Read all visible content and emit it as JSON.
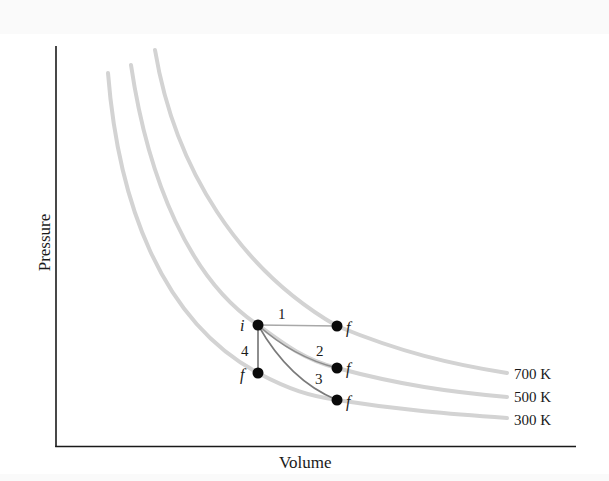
{
  "diagram": {
    "type": "PV diagram with isotherms",
    "axes": {
      "x_label": "Volume",
      "y_label": "Pressure"
    },
    "isotherms": [
      {
        "label": "700 K",
        "color": "#d0d0d0"
      },
      {
        "label": "500 K",
        "color": "#d0d0d0"
      },
      {
        "label": "300 K",
        "color": "#d0d0d0"
      }
    ],
    "initial_state": {
      "label": "i"
    },
    "final_states": [
      {
        "label": "f",
        "path": "1"
      },
      {
        "label": "f",
        "path": "2"
      },
      {
        "label": "f",
        "path": "3"
      },
      {
        "label": "f",
        "path": "4"
      }
    ],
    "paths": [
      {
        "label": "1",
        "description": "isobaric expansion from i to f on 700 K isotherm"
      },
      {
        "label": "2",
        "description": "curved path from i to f on 500 K isotherm"
      },
      {
        "label": "3",
        "description": "curved path from i to f on 300 K isotherm"
      },
      {
        "label": "4",
        "description": "isochoric path from i to f on 300 K isotherm"
      }
    ],
    "colors": {
      "axis": "#1a1a1a",
      "isotherm": "#d0d0d0",
      "process_path": "#9a9a9a",
      "point": "#0a0a0a"
    }
  }
}
